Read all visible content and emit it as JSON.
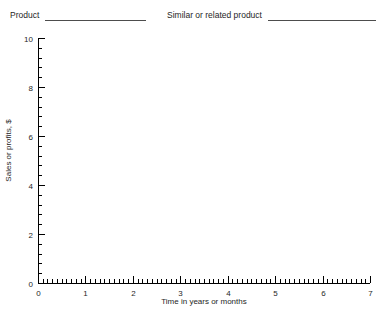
{
  "header": {
    "fields": [
      {
        "label": "Product",
        "value": "",
        "blank": true
      },
      {
        "label": "Similar or related product",
        "value": "",
        "blank": true
      }
    ]
  },
  "chart_data": {
    "type": "line",
    "title": "",
    "xlabel": "Time in years or months",
    "ylabel": "Sales or profits, $",
    "xlim": [
      0,
      7
    ],
    "ylim": [
      0,
      10
    ],
    "x_major_ticks": [
      0,
      1,
      2,
      3,
      4,
      5,
      6,
      7
    ],
    "x_tick_labels": [
      "0",
      "1",
      "2",
      "3",
      "4",
      "5",
      "6",
      "7"
    ],
    "x_minor_interval": 0.1,
    "y_major_ticks": [
      0,
      2,
      4,
      6,
      8,
      10
    ],
    "y_tick_labels": [
      "0",
      "2",
      "4",
      "6",
      "8",
      "10"
    ],
    "y_minor_interval": 0.4,
    "grid": false,
    "legend": false,
    "series": [],
    "values": [],
    "x": [],
    "annotations": [],
    "note": "Blank plotting worksheet - axes drawn with no data series plotted"
  },
  "colors": {
    "axis": "#000000",
    "text": "#262626",
    "background": "#ffffff",
    "rule": "#4d4d4d"
  }
}
